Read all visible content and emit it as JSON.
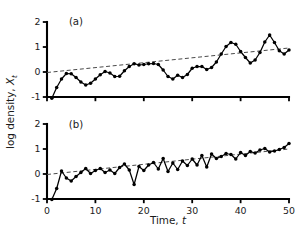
{
  "chart_data": [
    {
      "id": "panel-a",
      "type": "line",
      "title": "(a)",
      "xlabel": "Time, t",
      "ylabel": "log density, X_t",
      "xlim": [
        0,
        50
      ],
      "ylim": [
        -1,
        2
      ],
      "xticks": [
        0,
        10,
        20,
        30,
        40,
        50
      ],
      "yticks": [
        -1,
        0,
        1,
        2
      ],
      "grid": false,
      "legend": "none",
      "markers": "filled-circle",
      "x": [
        1,
        2,
        3,
        4,
        5,
        6,
        7,
        8,
        9,
        10,
        11,
        12,
        13,
        14,
        15,
        16,
        17,
        18,
        19,
        20,
        21,
        22,
        23,
        24,
        25,
        26,
        27,
        28,
        29,
        30,
        31,
        32,
        33,
        34,
        35,
        36,
        37,
        38,
        39,
        40,
        41,
        42,
        43,
        44,
        45,
        46,
        47,
        48,
        49,
        50
      ],
      "values": [
        -1.05,
        -0.62,
        -0.28,
        -0.06,
        -0.07,
        -0.22,
        -0.4,
        -0.52,
        -0.45,
        -0.28,
        -0.11,
        0.02,
        -0.04,
        -0.18,
        -0.17,
        0.05,
        0.22,
        0.33,
        0.28,
        0.3,
        0.33,
        0.34,
        0.3,
        0.08,
        -0.18,
        -0.28,
        -0.13,
        -0.22,
        -0.1,
        0.15,
        0.22,
        0.22,
        0.1,
        0.18,
        0.4,
        0.72,
        1.02,
        1.18,
        1.11,
        0.82,
        0.58,
        0.36,
        0.48,
        0.78,
        1.2,
        1.48,
        1.18,
        0.85,
        0.72,
        0.88
      ],
      "trend": {
        "label": "fitted linear trend",
        "style": "dashed",
        "x": [
          0,
          50
        ],
        "y": [
          -0.02,
          0.96
        ]
      }
    },
    {
      "id": "panel-b",
      "type": "line",
      "title": "(b)",
      "xlabel": "Time, t",
      "ylabel": "log density, X_t",
      "xlim": [
        0,
        50
      ],
      "ylim": [
        -1,
        2
      ],
      "xticks": [
        0,
        10,
        20,
        30,
        40,
        50
      ],
      "yticks": [
        -1,
        0,
        1,
        2
      ],
      "grid": false,
      "legend": "none",
      "markers": "filled-circle",
      "x": [
        1,
        2,
        3,
        4,
        5,
        6,
        7,
        8,
        9,
        10,
        11,
        12,
        13,
        14,
        15,
        16,
        17,
        18,
        19,
        20,
        21,
        22,
        23,
        24,
        25,
        26,
        27,
        28,
        29,
        30,
        31,
        32,
        33,
        34,
        35,
        36,
        37,
        38,
        39,
        40,
        41,
        42,
        43,
        44,
        45,
        46,
        47,
        48,
        49,
        50
      ],
      "values": [
        -1.02,
        -0.58,
        0.12,
        -0.16,
        -0.28,
        -0.1,
        0.06,
        0.22,
        0.02,
        0.14,
        0.22,
        0.06,
        0.16,
        0.02,
        0.26,
        0.4,
        0.16,
        -0.42,
        0.3,
        0.14,
        0.36,
        0.46,
        0.2,
        0.62,
        0.1,
        0.44,
        0.18,
        0.52,
        0.34,
        0.6,
        0.36,
        0.74,
        0.28,
        0.8,
        0.62,
        0.7,
        0.82,
        0.78,
        0.6,
        0.86,
        0.74,
        0.9,
        0.84,
        0.96,
        1.02,
        0.88,
        0.92,
        0.98,
        1.06,
        1.22
      ],
      "trend": {
        "label": "fitted linear trend",
        "style": "dashed",
        "x": [
          0,
          50
        ],
        "y": [
          -0.02,
          1.0
        ]
      }
    }
  ],
  "figure": {
    "y_axis_title_prefix": "log density, ",
    "y_axis_title_symbol": "X",
    "y_axis_title_subscript": "t",
    "x_axis_title_prefix": "Time, ",
    "x_axis_title_symbol": "t",
    "panel_a_label": "(a)",
    "panel_b_label": "(b)",
    "colors": {
      "line": "#000000",
      "marker": "#000000",
      "trend": "#4a4a4a",
      "axis": "#000000",
      "text": "#1a1a1a",
      "background": "#ffffff"
    }
  }
}
